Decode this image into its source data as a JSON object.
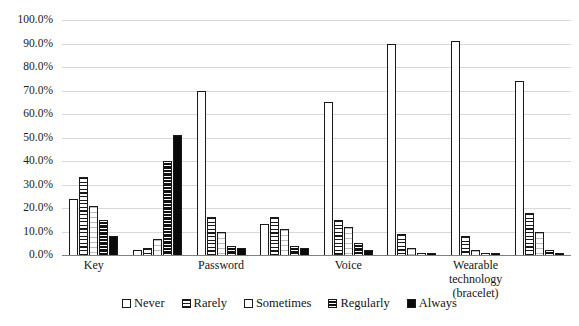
{
  "chart_data": {
    "type": "bar",
    "title": "",
    "xlabel": "",
    "ylabel": "",
    "ylim": [
      0,
      100
    ],
    "y_ticks": [
      "0.0%",
      "10.0%",
      "20.0%",
      "30.0%",
      "40.0%",
      "50.0%",
      "60.0%",
      "70.0%",
      "80.0%",
      "90.0%",
      "100.0%"
    ],
    "y_tick_values": [
      0,
      10,
      20,
      30,
      40,
      50,
      60,
      70,
      80,
      90,
      100
    ],
    "grid": true,
    "legend_position": "bottom",
    "legend": [
      "Never",
      "Rarely",
      "Sometimes",
      "Regularly",
      "Always"
    ],
    "categories": [
      "Key",
      "",
      "Password",
      "",
      "Voice",
      "",
      "Wearable technology\n(bracelet)",
      ""
    ],
    "series": [
      {
        "name": "Never",
        "values": [
          24,
          2,
          70,
          13,
          65,
          90,
          91,
          74
        ]
      },
      {
        "name": "Rarely",
        "values": [
          33,
          3,
          16,
          16,
          15,
          9,
          8,
          18
        ]
      },
      {
        "name": "Sometimes",
        "values": [
          21,
          7,
          10,
          11,
          12,
          3,
          2,
          10
        ]
      },
      {
        "name": "Regularly",
        "values": [
          15,
          40,
          4,
          4,
          5,
          1,
          1,
          2
        ]
      },
      {
        "name": "Always",
        "values": [
          8,
          51,
          3,
          3,
          2,
          1,
          1,
          1
        ]
      }
    ]
  },
  "legend": {
    "items": [
      {
        "label": "Never",
        "style": "s-never"
      },
      {
        "label": "Rarely",
        "style": "s-rarely"
      },
      {
        "label": "Sometimes",
        "style": "s-sometimes"
      },
      {
        "label": "Regularly",
        "style": "s-regularly"
      },
      {
        "label": "Always",
        "style": "s-always"
      }
    ]
  }
}
